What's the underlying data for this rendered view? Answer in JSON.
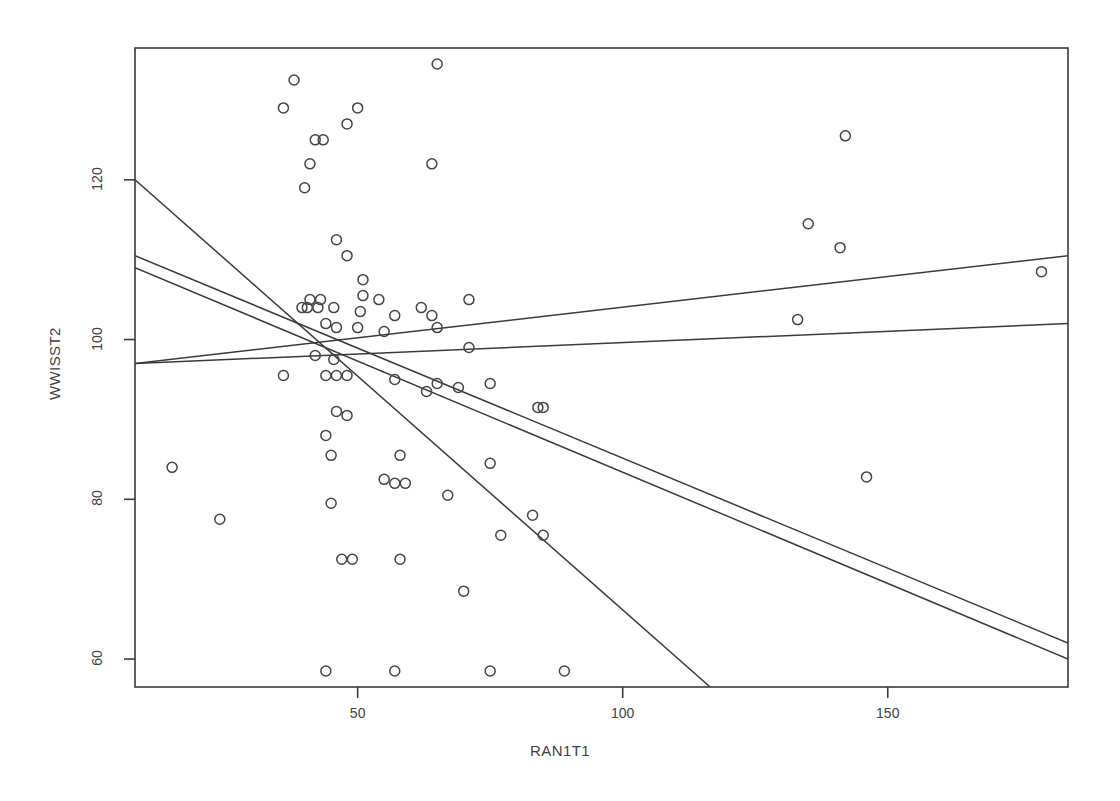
{
  "chart_data": {
    "type": "scatter",
    "title": "",
    "xlabel": "RAN1T1",
    "ylabel": "WWISST2",
    "xlim": [
      8,
      184
    ],
    "ylim": [
      56.5,
      136.5
    ],
    "xticks": [
      50,
      100,
      150
    ],
    "yticks": [
      60,
      80,
      100,
      120
    ],
    "xtick_labels": [
      "50",
      "100",
      "150"
    ],
    "ytick_labels": [
      "60",
      "80",
      "100",
      "120"
    ],
    "grid": false,
    "legend": "none",
    "marker": "open-circle",
    "marker_color": "#444444",
    "line_color": "#3a3a3a",
    "frame": true,
    "points": [
      [
        65,
        134.5
      ],
      [
        38,
        132.5
      ],
      [
        36,
        129
      ],
      [
        50,
        129
      ],
      [
        48,
        127
      ],
      [
        42,
        125
      ],
      [
        43.5,
        125
      ],
      [
        142,
        125.5
      ],
      [
        41,
        122
      ],
      [
        64,
        122
      ],
      [
        40,
        119
      ],
      [
        135,
        114.5
      ],
      [
        46,
        112.5
      ],
      [
        141,
        111.5
      ],
      [
        48,
        110.5
      ],
      [
        179,
        108.5
      ],
      [
        51,
        107.5
      ],
      [
        51,
        105.5
      ],
      [
        41,
        105
      ],
      [
        43,
        105
      ],
      [
        54,
        105
      ],
      [
        71,
        105
      ],
      [
        39.5,
        104
      ],
      [
        40.5,
        104
      ],
      [
        42.5,
        104
      ],
      [
        45.5,
        104
      ],
      [
        50.5,
        103.5
      ],
      [
        62,
        104
      ],
      [
        64,
        103
      ],
      [
        57,
        103
      ],
      [
        133,
        102.5
      ],
      [
        44,
        102
      ],
      [
        46,
        101.5
      ],
      [
        50,
        101.5
      ],
      [
        55,
        101
      ],
      [
        65,
        101.5
      ],
      [
        71,
        99
      ],
      [
        42,
        98
      ],
      [
        45.5,
        97.5
      ],
      [
        36,
        95.5
      ],
      [
        44,
        95.5
      ],
      [
        46,
        95.5
      ],
      [
        48,
        95.5
      ],
      [
        57,
        95
      ],
      [
        65,
        94.5
      ],
      [
        63,
        93.5
      ],
      [
        69,
        94
      ],
      [
        75,
        94.5
      ],
      [
        84,
        91.5
      ],
      [
        85,
        91.5
      ],
      [
        46,
        91
      ],
      [
        48,
        90.5
      ],
      [
        44,
        88
      ],
      [
        45,
        85.5
      ],
      [
        58,
        85.5
      ],
      [
        146,
        82.8
      ],
      [
        15,
        84
      ],
      [
        75,
        84.5
      ],
      [
        55,
        82.5
      ],
      [
        57,
        82
      ],
      [
        59,
        82
      ],
      [
        67,
        80.5
      ],
      [
        45,
        79.5
      ],
      [
        24,
        77.5
      ],
      [
        83,
        78
      ],
      [
        77,
        75.5
      ],
      [
        85,
        75.5
      ],
      [
        47,
        72.5
      ],
      [
        49,
        72.5
      ],
      [
        58,
        72.5
      ],
      [
        70,
        68.5
      ],
      [
        44,
        58.5
      ],
      [
        57,
        58.5
      ],
      [
        75,
        58.5
      ],
      [
        89,
        58.5
      ]
    ],
    "lines": [
      {
        "name": "steep-negative-line",
        "x1": 8,
        "y1": 120.0,
        "x2": 116.5,
        "y2": 56.5
      },
      {
        "name": "negative-line-upper",
        "x1": 8,
        "y1": 110.5,
        "x2": 184,
        "y2": 62.0
      },
      {
        "name": "negative-line-lower",
        "x1": 8,
        "y1": 109.0,
        "x2": 184,
        "y2": 60.0
      },
      {
        "name": "positive-line-upper",
        "x1": 8,
        "y1": 97.0,
        "x2": 184,
        "y2": 110.5
      },
      {
        "name": "positive-line-lower",
        "x1": 8,
        "y1": 97.0,
        "x2": 184,
        "y2": 102.0
      }
    ]
  },
  "axes": {
    "x_title": "RAN1T1",
    "y_title": "WWISST2"
  }
}
